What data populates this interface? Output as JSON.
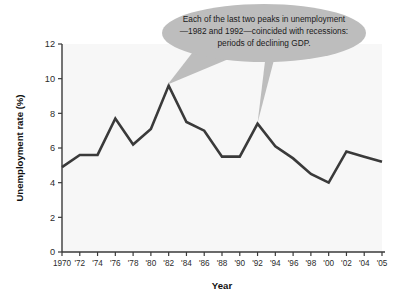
{
  "chart_data": {
    "type": "line",
    "title": "",
    "subtitle": "",
    "xlabel": "Year",
    "ylabel": "Unemployment rate (%)",
    "x": [
      1970,
      1972,
      1974,
      1976,
      1978,
      1980,
      1982,
      1984,
      1986,
      1988,
      1990,
      1992,
      1994,
      1996,
      1998,
      2000,
      2002,
      2004,
      2005
    ],
    "categories": [
      "1970",
      "'72",
      "'74",
      "'76",
      "'78",
      "'80",
      "'82",
      "'84",
      "'86",
      "'88",
      "'90",
      "'92",
      "'94",
      "'96",
      "'98",
      "'00",
      "'02",
      "'04",
      "'05"
    ],
    "values": [
      4.9,
      5.6,
      5.6,
      7.7,
      6.2,
      7.1,
      9.6,
      7.5,
      7.0,
      5.5,
      5.5,
      7.4,
      6.1,
      5.4,
      4.5,
      4.0,
      5.8,
      5.5,
      5.2
    ],
    "series": [
      {
        "name": "Unemployment rate",
        "values": [
          4.9,
          5.6,
          5.6,
          7.7,
          6.2,
          7.1,
          9.6,
          7.5,
          7.0,
          5.5,
          5.5,
          7.4,
          6.1,
          5.4,
          4.5,
          4.0,
          5.8,
          5.5,
          5.2
        ],
        "color": "#3a3a3a"
      }
    ],
    "ylim": [
      0,
      12
    ],
    "yticks": [
      0,
      2,
      4,
      6,
      8,
      10,
      12
    ],
    "ytick_labels": [
      "0",
      "2",
      "4",
      "6",
      "8",
      "10",
      "12"
    ],
    "xtick_labels": [
      "1970",
      "'72",
      "'74",
      "'76",
      "'78",
      "'80",
      "'82",
      "'84",
      "'86",
      "'88",
      "'90",
      "'92",
      "'94",
      "'96",
      "'98",
      "'00",
      "'02",
      "'04",
      "'05"
    ],
    "grid": false,
    "legend": "none",
    "annotations": [
      {
        "id": "recession-callout",
        "lines": [
          "Each of the last two peaks in unemployment",
          "—1982 and 1992—coincided with recessions:",
          "periods of declining GDP."
        ],
        "points_to": [
          "1982",
          "1992"
        ],
        "fill": "#bdbdbd"
      }
    ]
  },
  "axes": {
    "y_title": "Unemployment rate (%)",
    "x_title": "Year",
    "ytick_labels": [
      "12",
      "10",
      "8",
      "6",
      "4",
      "2",
      "0"
    ],
    "xtick_labels": [
      "1970",
      "'72",
      "'74",
      "'76",
      "'78",
      "'80",
      "'82",
      "'84",
      "'86",
      "'88",
      "'90",
      "'92",
      "'94",
      "'96",
      "'98",
      "'00",
      "'02",
      "'04",
      "'05"
    ]
  },
  "callout": {
    "line1": "Each of the last two peaks in unemployment",
    "line2": "—1982 and 1992—coincided with recessions:",
    "line3": "periods of declining GDP."
  },
  "colors": {
    "line": "#3a3a3a",
    "axis": "#3a3a3a",
    "callout_fill": "#bdbdbd",
    "plot_background": "#f7f7f7",
    "page_background": "#ffffff",
    "text": "#1a1a1a"
  }
}
